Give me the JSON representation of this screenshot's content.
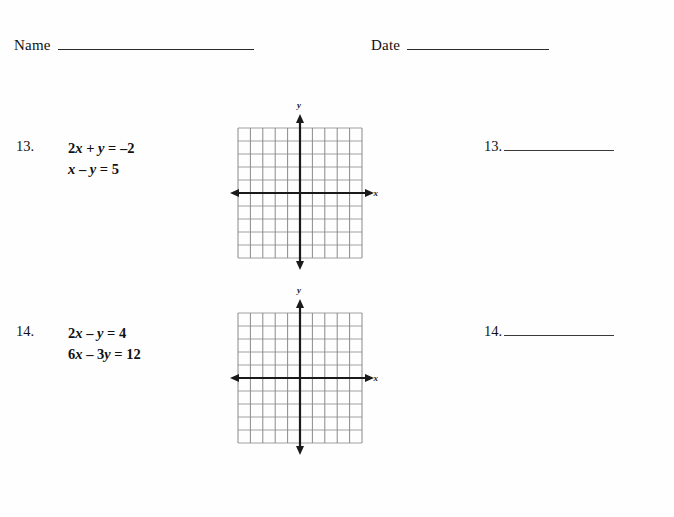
{
  "page": {
    "background_color": "#ffffff",
    "ink_color": "#111111"
  },
  "header": {
    "name_label": "Name",
    "date_label": "Date"
  },
  "problems": [
    {
      "number": "13.",
      "equations": [
        "2x + y = –2",
        "x – y = 5"
      ],
      "answer_number": "13.",
      "answer_value": ""
    },
    {
      "number": "14.",
      "equations": [
        "2x – y = 4",
        "6x – 3y = 12"
      ],
      "answer_number": "14.",
      "answer_value": ""
    }
  ],
  "grids": [
    {
      "name": "coordinate-grid-13",
      "x_axis_label": "x",
      "y_axis_label": "y",
      "columns": 10,
      "rows": 10,
      "x_range": [
        -5,
        5
      ],
      "y_range": [
        -5,
        5
      ],
      "grid_color": "#7d7d7d",
      "axis_color": "#1a1a1a",
      "ticks_visible": false,
      "numbers_visible": false
    },
    {
      "name": "coordinate-grid-14",
      "x_axis_label": "x",
      "y_axis_label": "y",
      "columns": 10,
      "rows": 10,
      "x_range": [
        -5,
        5
      ],
      "y_range": [
        -5,
        5
      ],
      "grid_color": "#7d7d7d",
      "axis_color": "#1a1a1a",
      "ticks_visible": false,
      "numbers_visible": false
    }
  ]
}
